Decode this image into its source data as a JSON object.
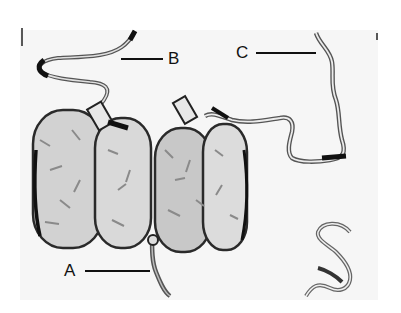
{
  "figure": {
    "type": "illustration",
    "labels": [
      {
        "id": "A",
        "text": "A",
        "points_to": "linker DNA below core"
      },
      {
        "id": "B",
        "text": "B",
        "points_to": "DNA strand upper left"
      },
      {
        "id": "C",
        "text": "C",
        "points_to": "DNA strand upper right"
      }
    ],
    "colors": {
      "background": "#ffffff",
      "plate": "#f6f6f6",
      "ink": "#1a1a1a",
      "shading_dark": "#6e6e6e",
      "shading_light": "#c4c4c4"
    }
  }
}
